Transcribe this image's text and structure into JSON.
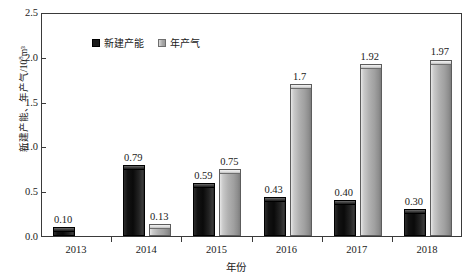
{
  "chart_data": {
    "type": "bar",
    "title": "",
    "xlabel": "年份",
    "ylabel": "新建产能、年产气/10⁸m³",
    "ylabel_main": "新建产能、年产气/10",
    "ylabel_exp": "8",
    "ylabel_tail": "m³",
    "categories": [
      "2013",
      "2014",
      "2015",
      "2016",
      "2017",
      "2018"
    ],
    "series": [
      {
        "name": "新建产能",
        "color": "#121212",
        "values": [
          0.1,
          0.79,
          0.59,
          0.43,
          0.4,
          0.3
        ],
        "labels": [
          "0.10",
          "0.79",
          "0.59",
          "0.43",
          "0.40",
          "0.30"
        ]
      },
      {
        "name": "年产气",
        "color": "#a8a8a8",
        "values": [
          null,
          0.13,
          0.75,
          1.7,
          1.92,
          1.97
        ],
        "labels": [
          "",
          "0.13",
          "0.75",
          "1.7",
          "1.92",
          "1.97"
        ]
      }
    ],
    "ylim": [
      0.0,
      2.5
    ],
    "yticks": [
      "0.0",
      "0.5",
      "1.0",
      "1.5",
      "2.0",
      "2.5"
    ],
    "ytick_values": [
      0.0,
      0.5,
      1.0,
      1.5,
      2.0,
      2.5
    ],
    "grid": false,
    "legend_position": "top-left"
  }
}
